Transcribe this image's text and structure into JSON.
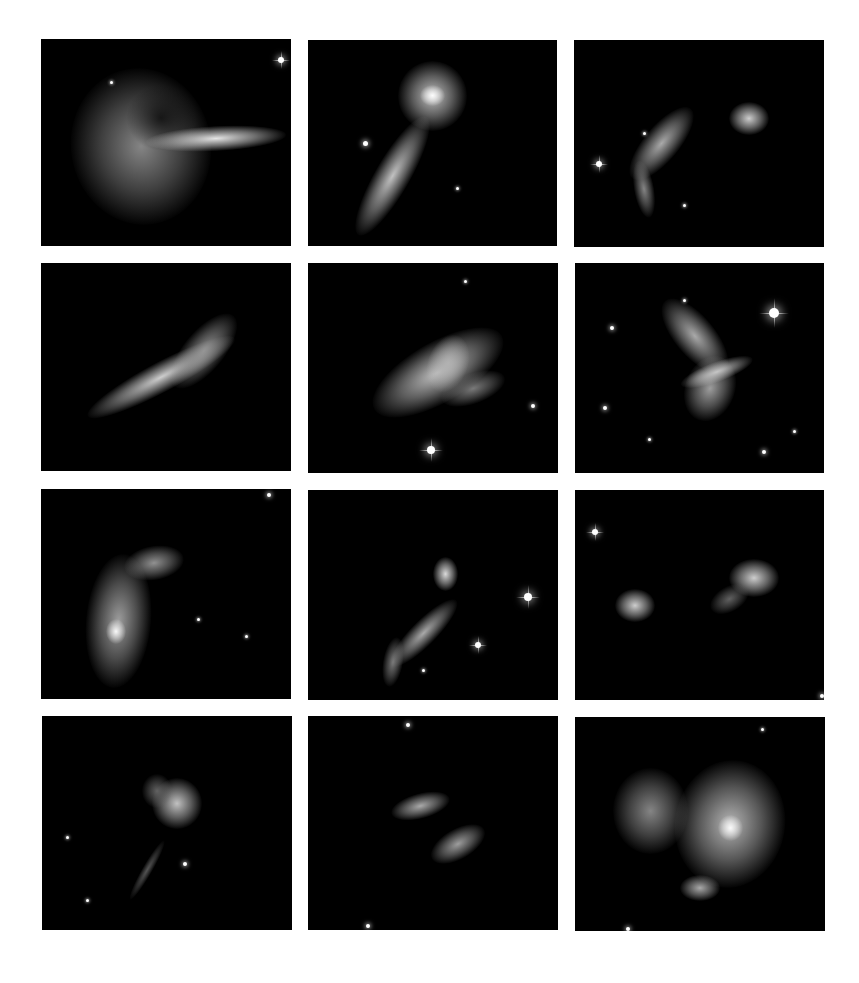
{
  "figure": {
    "background": "#ffffff",
    "grid": {
      "rows": 4,
      "cols": 3
    },
    "panels": [
      {
        "id": "p1",
        "x": 41,
        "y": 39,
        "w": 250,
        "h": 207,
        "blobs": [
          {
            "cx": 40,
            "cy": 52,
            "rx": 28,
            "ry": 38,
            "rot": -10,
            "b": 0.55
          },
          {
            "cx": 48,
            "cy": 38,
            "rx": 14,
            "ry": 16,
            "rot": 0,
            "b": 0.15,
            "dark": true
          },
          {
            "cx": 70,
            "cy": 48,
            "rx": 28,
            "ry": 6,
            "rot": -3,
            "b": 0.95
          }
        ],
        "stars": [
          [
            96,
            10,
            3
          ],
          [
            28,
            21,
            1.5
          ]
        ]
      },
      {
        "id": "p2",
        "x": 308,
        "y": 40,
        "w": 249,
        "h": 206,
        "blobs": [
          {
            "cx": 50,
            "cy": 27,
            "rx": 14,
            "ry": 17,
            "rot": 0,
            "b": 0.8
          },
          {
            "cx": 50,
            "cy": 27,
            "rx": 5,
            "ry": 5,
            "rot": 0,
            "b": 1
          },
          {
            "cx": 34,
            "cy": 66,
            "rx": 7,
            "ry": 33,
            "rot": 30,
            "b": 0.8
          }
        ],
        "stars": [
          [
            23,
            50,
            2.5
          ],
          [
            60,
            72,
            1.5
          ]
        ]
      },
      {
        "id": "p3",
        "x": 574,
        "y": 40,
        "w": 250,
        "h": 207,
        "blobs": [
          {
            "cx": 35,
            "cy": 50,
            "rx": 7,
            "ry": 22,
            "rot": 40,
            "b": 0.7
          },
          {
            "cx": 28,
            "cy": 72,
            "rx": 4,
            "ry": 14,
            "rot": -10,
            "b": 0.55
          },
          {
            "cx": 70,
            "cy": 38,
            "rx": 8,
            "ry": 8,
            "rot": 0,
            "b": 0.85
          }
        ],
        "stars": [
          [
            10,
            60,
            3
          ],
          [
            28,
            45,
            1.5
          ],
          [
            44,
            80,
            1.5
          ]
        ]
      },
      {
        "id": "p4",
        "x": 41,
        "y": 263,
        "w": 250,
        "h": 208,
        "blobs": [
          {
            "cx": 48,
            "cy": 55,
            "rx": 6,
            "ry": 40,
            "rot": 62,
            "b": 0.85
          },
          {
            "cx": 65,
            "cy": 42,
            "rx": 8,
            "ry": 22,
            "rot": 40,
            "b": 0.6
          }
        ],
        "stars": []
      },
      {
        "id": "p5",
        "x": 308,
        "y": 263,
        "w": 250,
        "h": 210,
        "blobs": [
          {
            "cx": 52,
            "cy": 52,
            "rx": 12,
            "ry": 35,
            "rot": 60,
            "b": 0.8
          },
          {
            "cx": 56,
            "cy": 48,
            "rx": 8,
            "ry": 14,
            "rot": 20,
            "b": 0.7
          },
          {
            "cx": 66,
            "cy": 60,
            "rx": 6,
            "ry": 16,
            "rot": 70,
            "b": 0.5
          }
        ],
        "stars": [
          [
            49,
            89,
            4
          ],
          [
            90,
            68,
            2
          ],
          [
            63,
            9,
            1.5
          ]
        ]
      },
      {
        "id": "p6",
        "x": 575,
        "y": 263,
        "w": 249,
        "h": 210,
        "blobs": [
          {
            "cx": 48,
            "cy": 35,
            "rx": 8,
            "ry": 22,
            "rot": -40,
            "b": 0.7
          },
          {
            "cx": 54,
            "cy": 60,
            "rx": 10,
            "ry": 16,
            "rot": 20,
            "b": 0.65
          },
          {
            "cx": 57,
            "cy": 52,
            "rx": 4,
            "ry": 18,
            "rot": 70,
            "b": 0.8
          }
        ],
        "stars": [
          [
            80,
            24,
            5
          ],
          [
            15,
            31,
            2
          ],
          [
            12,
            69,
            2
          ],
          [
            76,
            90,
            2
          ],
          [
            30,
            84,
            1.5
          ],
          [
            88,
            80,
            1.5
          ],
          [
            44,
            18,
            1.5
          ]
        ]
      },
      {
        "id": "p7",
        "x": 41,
        "y": 489,
        "w": 250,
        "h": 210,
        "blobs": [
          {
            "cx": 31,
            "cy": 63,
            "rx": 13,
            "ry": 32,
            "rot": 5,
            "b": 0.65
          },
          {
            "cx": 30,
            "cy": 68,
            "rx": 4,
            "ry": 6,
            "rot": 0,
            "b": 1
          },
          {
            "cx": 45,
            "cy": 35,
            "rx": 12,
            "ry": 8,
            "rot": -10,
            "b": 0.6
          }
        ],
        "stars": [
          [
            91,
            3,
            2
          ],
          [
            82,
            70,
            1.5
          ],
          [
            63,
            62,
            1.5
          ]
        ]
      },
      {
        "id": "p8",
        "x": 308,
        "y": 490,
        "w": 250,
        "h": 210,
        "blobs": [
          {
            "cx": 55,
            "cy": 40,
            "rx": 5,
            "ry": 8,
            "rot": 0,
            "b": 0.9
          },
          {
            "cx": 46,
            "cy": 68,
            "rx": 5,
            "ry": 22,
            "rot": 45,
            "b": 0.7
          },
          {
            "cx": 34,
            "cy": 82,
            "rx": 4,
            "ry": 12,
            "rot": 10,
            "b": 0.5
          }
        ],
        "stars": [
          [
            88,
            51,
            4
          ],
          [
            68,
            74,
            3
          ],
          [
            46,
            86,
            1.5
          ]
        ]
      },
      {
        "id": "p9",
        "x": 575,
        "y": 490,
        "w": 249,
        "h": 210,
        "blobs": [
          {
            "cx": 72,
            "cy": 42,
            "rx": 10,
            "ry": 9,
            "rot": 0,
            "b": 0.85
          },
          {
            "cx": 24,
            "cy": 55,
            "rx": 8,
            "ry": 8,
            "rot": 0,
            "b": 0.85
          },
          {
            "cx": 62,
            "cy": 52,
            "rx": 5,
            "ry": 10,
            "rot": 60,
            "b": 0.4
          }
        ],
        "stars": [
          [
            8,
            20,
            3
          ],
          [
            99,
            98,
            2
          ]
        ]
      },
      {
        "id": "p10",
        "x": 42,
        "y": 716,
        "w": 250,
        "h": 214,
        "blobs": [
          {
            "cx": 54,
            "cy": 41,
            "rx": 10,
            "ry": 12,
            "rot": 0,
            "b": 0.8
          },
          {
            "cx": 46,
            "cy": 35,
            "rx": 6,
            "ry": 8,
            "rot": 0,
            "b": 0.4
          },
          {
            "cx": 42,
            "cy": 72,
            "rx": 2,
            "ry": 16,
            "rot": 30,
            "b": 0.35
          }
        ],
        "stars": [
          [
            10,
            57,
            1.5
          ],
          [
            18,
            86,
            1.5
          ],
          [
            57,
            69,
            2
          ]
        ]
      },
      {
        "id": "p11",
        "x": 308,
        "y": 716,
        "w": 250,
        "h": 214,
        "blobs": [
          {
            "cx": 45,
            "cy": 42,
            "rx": 5,
            "ry": 14,
            "rot": 75,
            "b": 0.7
          },
          {
            "cx": 60,
            "cy": 60,
            "rx": 6,
            "ry": 14,
            "rot": 60,
            "b": 0.65
          }
        ],
        "stars": [
          [
            40,
            4,
            2
          ],
          [
            24,
            98,
            2
          ]
        ]
      },
      {
        "id": "p12",
        "x": 575,
        "y": 717,
        "w": 250,
        "h": 214,
        "blobs": [
          {
            "cx": 62,
            "cy": 50,
            "rx": 22,
            "ry": 30,
            "rot": 10,
            "b": 0.75
          },
          {
            "cx": 62,
            "cy": 52,
            "rx": 5,
            "ry": 6,
            "rot": 0,
            "b": 1
          },
          {
            "cx": 30,
            "cy": 44,
            "rx": 15,
            "ry": 20,
            "rot": 0,
            "b": 0.55
          },
          {
            "cx": 50,
            "cy": 80,
            "rx": 8,
            "ry": 6,
            "rot": 0,
            "b": 0.7
          }
        ],
        "stars": [
          [
            75,
            6,
            1.5
          ],
          [
            21,
            99,
            2
          ]
        ]
      }
    ]
  }
}
